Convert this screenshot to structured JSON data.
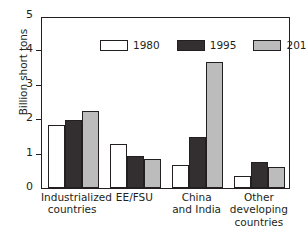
{
  "chart_data": {
    "type": "bar",
    "title": "",
    "xlabel": "",
    "ylabel": "Billion short tons",
    "ylim": [
      0,
      5
    ],
    "yticks": [
      "0",
      "1",
      "2",
      "3",
      "4",
      "5"
    ],
    "grid": false,
    "legend_position": "top-inside",
    "categories": [
      "Industrialized countries",
      "EE/FSU",
      "China and India",
      "Other developing countries"
    ],
    "category_lines": [
      [
        "Industrialized",
        "countries"
      ],
      [
        "EE/FSU"
      ],
      [
        "China",
        "and India"
      ],
      [
        "Other",
        "developing",
        "countries"
      ]
    ],
    "series": [
      {
        "name": "1980",
        "color": "#ffffff",
        "values": [
          1.82,
          1.27,
          0.66,
          0.34
        ]
      },
      {
        "name": "1995",
        "color": "#332f30",
        "values": [
          1.98,
          0.92,
          1.47,
          0.77
        ]
      },
      {
        "name": "2015",
        "color": "#bcbcbc",
        "values": [
          2.25,
          0.84,
          3.67,
          0.61
        ]
      }
    ]
  }
}
